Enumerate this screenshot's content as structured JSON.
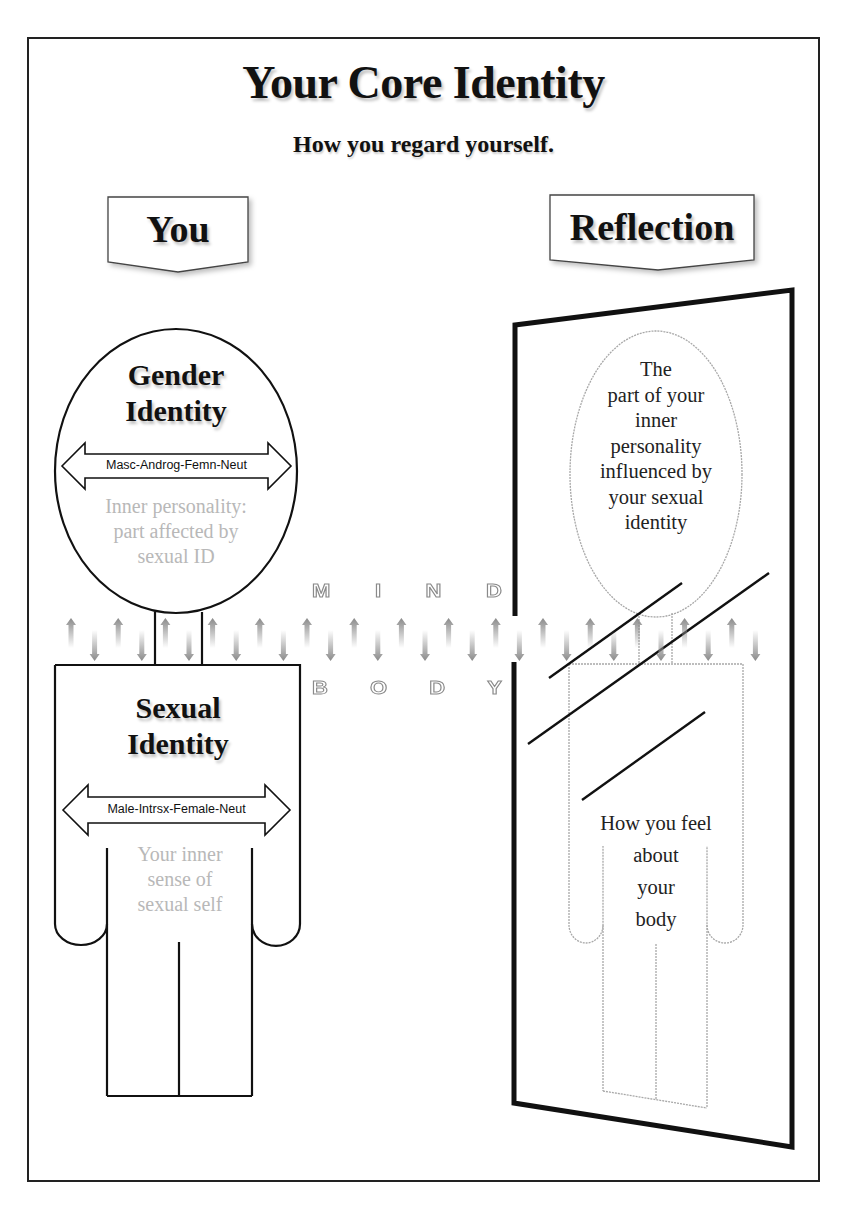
{
  "header": {
    "title": "Your Core Identity",
    "subtitle": "How you regard yourself."
  },
  "banners": {
    "you": "You",
    "reflection": "Reflection"
  },
  "you_figure": {
    "head": {
      "title_line1": "Gender",
      "title_line2": "Identity",
      "scale": "Masc-Androg-Femn-Neut",
      "desc_lines": [
        "Inner personality:",
        "part affected by",
        "sexual ID"
      ]
    },
    "body": {
      "title_line1": "Sexual",
      "title_line2": "Identity",
      "scale": "Male-Intrsx-Female-Neut",
      "desc_lines": [
        "Your inner",
        "sense of",
        "sexual self"
      ]
    }
  },
  "reflection_figure": {
    "head_lines": [
      "The",
      "part of your",
      "inner",
      "personality",
      "influenced by",
      "your sexual",
      "identity"
    ],
    "body_lines": [
      "How you feel",
      "about",
      "your",
      "body"
    ]
  },
  "divider": {
    "upper_word": [
      "M",
      "I",
      "N",
      "D"
    ],
    "lower_word": [
      "B",
      "O",
      "D",
      "Y"
    ],
    "arrow_count": 30
  },
  "colors": {
    "ink": "#111111",
    "faded_text": "#b8b8b8",
    "reflection_outline": "#a8a8a8",
    "arrow_grey": "#9a9a9a"
  }
}
